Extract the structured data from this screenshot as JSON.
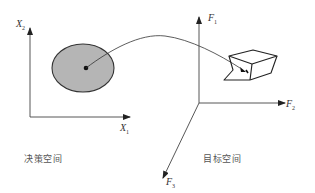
{
  "decision_space": {
    "label": "决策空间",
    "x_axis": {
      "name": "X",
      "sub": "1"
    },
    "y_axis": {
      "name": "X",
      "sub": "2"
    },
    "region_fill": "#b3b3b3"
  },
  "objective_space": {
    "label": "目标空间",
    "axis1": {
      "name": "F",
      "sub": "1"
    },
    "axis2": {
      "name": "F",
      "sub": "2"
    },
    "axis3": {
      "name": "F",
      "sub": "3"
    }
  },
  "colors": {
    "line": "#333333",
    "fill": "#b5b5b5",
    "text": "#555555"
  }
}
